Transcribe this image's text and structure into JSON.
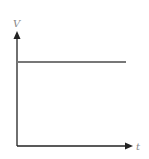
{
  "diagram": {
    "type": "voltage-time graph",
    "y_axis_label": "V",
    "x_axis_label": "t",
    "colors": {
      "axes": "#222222",
      "line": "#777777",
      "labels": "#888888"
    }
  }
}
